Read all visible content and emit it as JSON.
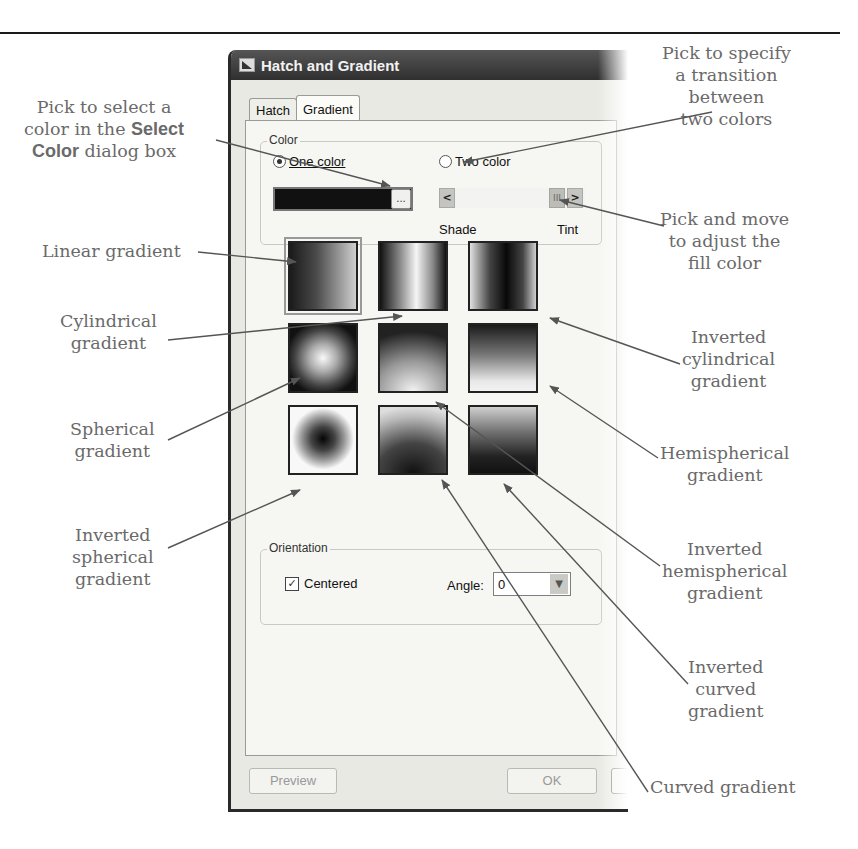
{
  "dialog": {
    "title": "Hatch and Gradient",
    "tabs": [
      {
        "label": "Hatch",
        "active": false
      },
      {
        "label": "Gradient",
        "active": true
      }
    ],
    "color_group": {
      "label": "Color",
      "one_color": {
        "label": "One color",
        "selected": true
      },
      "two_color": {
        "label": "Two color",
        "selected": false
      },
      "color_value": "#111111",
      "browse_label": "...",
      "slider": {
        "left_label": "Shade",
        "right_label": "Tint",
        "left_arrow": "<",
        "right_arrow": ">",
        "thumb": "III"
      }
    },
    "gradients": [
      {
        "name": "linear",
        "selected": true
      },
      {
        "name": "cylindrical",
        "selected": false
      },
      {
        "name": "inverted-cylindrical",
        "selected": false
      },
      {
        "name": "spherical",
        "selected": false
      },
      {
        "name": "hemispherical",
        "selected": false
      },
      {
        "name": "curved",
        "selected": false
      },
      {
        "name": "inverted-spherical",
        "selected": false
      },
      {
        "name": "inverted-hemispherical",
        "selected": false
      },
      {
        "name": "inverted-curved",
        "selected": false
      }
    ],
    "orientation_group": {
      "label": "Orientation",
      "centered": {
        "label": "Centered",
        "checked": true
      },
      "angle": {
        "label": "Angle:",
        "value": "0"
      }
    },
    "buttons": {
      "preview": "Preview",
      "ok": "OK"
    }
  },
  "callouts": {
    "select_color": {
      "line1": "Pick to select a",
      "line2_pre": "color in the ",
      "line2_bold": "Select",
      "line3_bold": "Color",
      "line3_post": " dialog box"
    },
    "two_colors": [
      "Pick to specify",
      "a transition",
      "between",
      "two colors"
    ],
    "linear": [
      "Linear gradient"
    ],
    "adjust_fill": [
      "Pick and move",
      "to adjust the",
      "fill color"
    ],
    "cylindrical": [
      "Cylindrical",
      "gradient"
    ],
    "inverted_cylindrical": [
      "Inverted",
      "cylindrical",
      "gradient"
    ],
    "spherical": [
      "Spherical",
      "gradient"
    ],
    "hemispherical": [
      "Hemispherical",
      "gradient"
    ],
    "inverted_spherical": [
      "Inverted",
      "spherical",
      "gradient"
    ],
    "inverted_hemispherical": [
      "Inverted",
      "hemispherical",
      "gradient"
    ],
    "inverted_curved": [
      "Inverted",
      "curved",
      "gradient"
    ],
    "curved": [
      "Curved gradient"
    ]
  }
}
